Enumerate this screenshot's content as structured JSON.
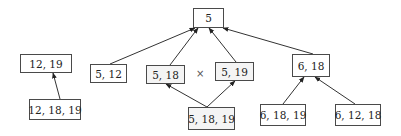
{
  "diagram": {
    "nodes": [
      {
        "id": "n5",
        "label": "5",
        "x": 193,
        "y": 8,
        "w": 31,
        "h": 20,
        "dotted": false
      },
      {
        "id": "n5_12",
        "label": "5, 12",
        "x": 90,
        "y": 64,
        "w": 37,
        "h": 19,
        "dotted": false
      },
      {
        "id": "n5_18",
        "label": "5, 18",
        "x": 146,
        "y": 65,
        "w": 39,
        "h": 19,
        "dotted": true
      },
      {
        "id": "n5_19",
        "label": "5, 19",
        "x": 215,
        "y": 62,
        "w": 39,
        "h": 19,
        "dotted": true
      },
      {
        "id": "n5_18_19",
        "label": "5, 18, 19",
        "x": 188,
        "y": 107,
        "w": 47,
        "h": 23,
        "dotted": true
      },
      {
        "id": "n6_18",
        "label": "6, 18",
        "x": 292,
        "y": 54,
        "w": 38,
        "h": 23,
        "dotted": false
      },
      {
        "id": "n6_18_19",
        "label": "6, 18, 19",
        "x": 260,
        "y": 104,
        "w": 46,
        "h": 22,
        "dotted": false
      },
      {
        "id": "n6_12_18",
        "label": "6, 12, 18",
        "x": 335,
        "y": 104,
        "w": 46,
        "h": 22,
        "dotted": false
      },
      {
        "id": "n12_19",
        "label": "12, 19",
        "x": 20,
        "y": 54,
        "w": 52,
        "h": 19,
        "dotted": false
      },
      {
        "id": "n12_18_19",
        "label": "12, 18, 19",
        "x": 29,
        "y": 99,
        "w": 52,
        "h": 21,
        "dotted": false
      }
    ],
    "edges": [
      {
        "from": "n5_12",
        "to": "n5",
        "x1": 110,
        "y1": 64,
        "x2": 195,
        "y2": 28
      },
      {
        "from": "n5_18",
        "to": "n5",
        "x1": 170,
        "y1": 65,
        "x2": 198,
        "y2": 28
      },
      {
        "from": "n5_19",
        "to": "n5",
        "x1": 236,
        "y1": 62,
        "x2": 209,
        "y2": 28
      },
      {
        "from": "n6_18",
        "to": "n5",
        "x1": 313,
        "y1": 54,
        "x2": 223,
        "y2": 28
      },
      {
        "from": "n5_18_19",
        "to": "n5_18",
        "x1": 207,
        "y1": 107,
        "x2": 166,
        "y2": 84
      },
      {
        "from": "n5_18_19",
        "to": "n5_19",
        "x1": 207,
        "y1": 107,
        "x2": 235,
        "y2": 81
      },
      {
        "from": "n6_18_19",
        "to": "n6_18",
        "x1": 283,
        "y1": 104,
        "x2": 304,
        "y2": 77
      },
      {
        "from": "n6_12_18",
        "to": "n6_18",
        "x1": 355,
        "y1": 104,
        "x2": 315,
        "y2": 77
      },
      {
        "from": "n12_18_19",
        "to": "n12_19",
        "x1": 60,
        "y1": 99,
        "x2": 53,
        "y2": 73
      }
    ],
    "annotations": [
      {
        "id": "incomparable-mark",
        "label": "×",
        "x": 196,
        "y": 68
      }
    ],
    "colors": {
      "stroke": "#333333",
      "dotted_fill": "#f4f4f4"
    }
  }
}
